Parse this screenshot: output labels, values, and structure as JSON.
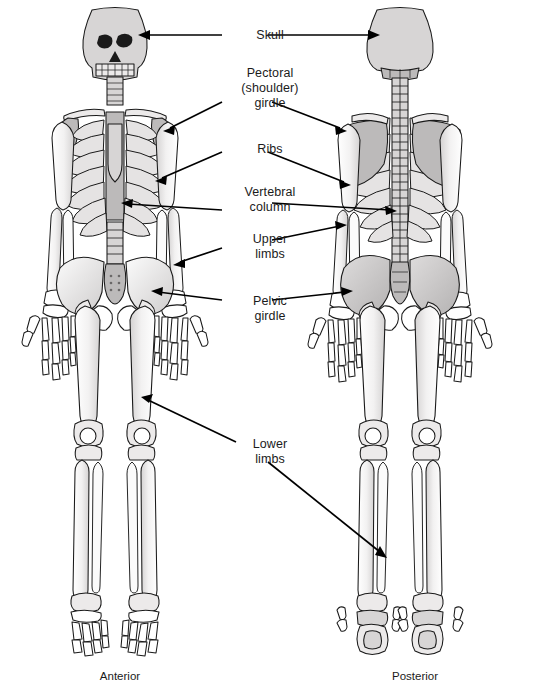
{
  "figure": {
    "background_color": "#ffffff",
    "text_color": "#1b1b1b",
    "leader_color": "#000000",
    "width": 540,
    "height": 692
  },
  "labels": [
    {
      "id": "skull",
      "text": "Skull",
      "x": 228,
      "y": 28,
      "width": 84,
      "arrow_style": "double-horizontal"
    },
    {
      "id": "pectoral",
      "text": "Pectoral\n(shoulder)\ngirdle",
      "x": 228,
      "y": 66,
      "width": 84,
      "arrow_style": "two-leaders"
    },
    {
      "id": "ribs",
      "text": "Ribs",
      "x": 228,
      "y": 142,
      "width": 84,
      "arrow_style": "two-leaders"
    },
    {
      "id": "vertebral",
      "text": "Vertebral\ncolumn",
      "x": 228,
      "y": 185,
      "width": 84,
      "arrow_style": "two-leaders"
    },
    {
      "id": "upper",
      "text": "Upper\nlimbs",
      "x": 228,
      "y": 232,
      "width": 84,
      "arrow_style": "two-leaders"
    },
    {
      "id": "pelvic",
      "text": "Pelvic\ngirdle",
      "x": 228,
      "y": 294,
      "width": 84,
      "arrow_style": "two-leaders"
    },
    {
      "id": "lower",
      "text": "Lower\nlimbs",
      "x": 228,
      "y": 437,
      "width": 84,
      "arrow_style": "two-leaders"
    }
  ],
  "captions": [
    {
      "id": "anterior",
      "text": "Anterior",
      "x": 60,
      "y": 670
    },
    {
      "id": "posterior",
      "text": "Posterior",
      "x": 355,
      "y": 670
    }
  ],
  "views": [
    {
      "id": "anterior-skeleton",
      "caption": "Anterior",
      "center_x": 115,
      "skull_style": "face-with-orbits-teeth"
    },
    {
      "id": "posterior-skeleton",
      "caption": "Posterior",
      "center_x": 400,
      "skull_style": "cranium-dome"
    }
  ],
  "bone_groups": [
    "skull",
    "clavicle",
    "scapula",
    "sternum",
    "ribs",
    "vertebral-column",
    "humerus",
    "radius",
    "ulna",
    "carpals",
    "metacarpals",
    "phalanges",
    "pelvis",
    "sacrum",
    "femur",
    "patella",
    "tibia",
    "fibula",
    "tarsals",
    "metatarsals",
    "toe-phalanges"
  ],
  "palette": {
    "bone_light": "#ffffff",
    "bone_shade_1": "#eceaea",
    "bone_shade_2": "#d7d5d5",
    "bone_shade_3": "#bcbaba",
    "outline": "#1a1a1a"
  }
}
